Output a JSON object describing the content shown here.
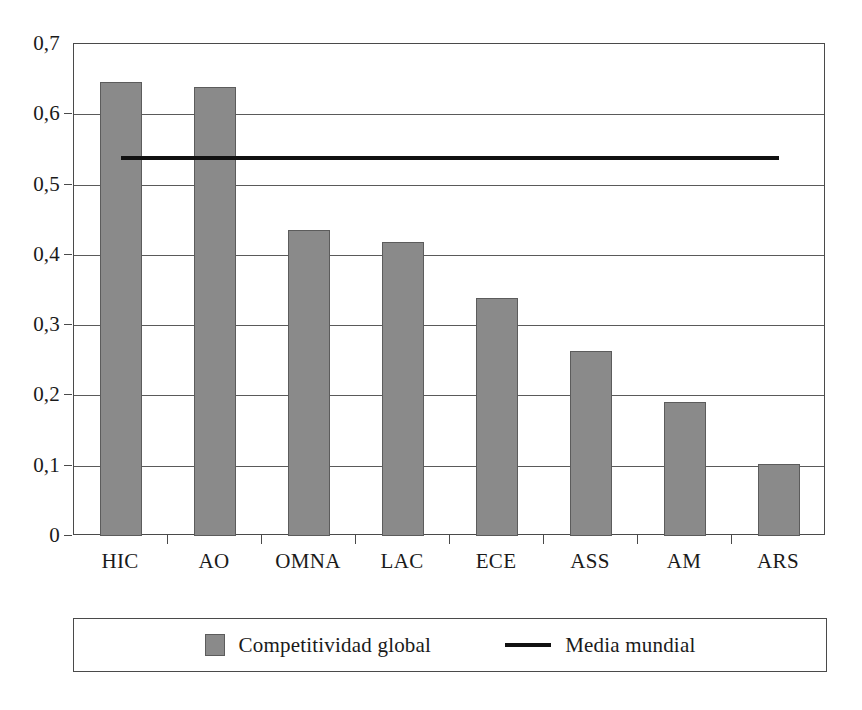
{
  "chart_data": {
    "type": "bar",
    "title": "",
    "subtitle": "",
    "xlabel": "",
    "ylabel": "",
    "categories": [
      "HIC",
      "AO",
      "OMNA",
      "LAC",
      "ECE",
      "ASS",
      "AM",
      "ARS"
    ],
    "series": [
      {
        "name": "Competitividad global",
        "type": "bar",
        "color": "#8a8a8a",
        "values": [
          0.646,
          0.639,
          0.436,
          0.419,
          0.339,
          0.263,
          0.19,
          0.103
        ]
      },
      {
        "name": "Media mundial",
        "type": "line",
        "color": "#111111",
        "constant_value": 0.54,
        "values": [
          0.54,
          0.54,
          0.54,
          0.54,
          0.54,
          0.54,
          0.54,
          0.54
        ]
      }
    ],
    "ylim": [
      0,
      0.7
    ],
    "ytick_labels": [
      "0,7",
      "0,6",
      "0,5",
      "0,4",
      "0,3",
      "0,2",
      "0,1",
      "0"
    ],
    "ytick_values": [
      0.7,
      0.6,
      0.5,
      0.4,
      0.3,
      0.2,
      0.1,
      0
    ],
    "grid": "horizontal",
    "legend_position": "bottom",
    "decimal_separator": ","
  },
  "legend": {
    "entries": [
      {
        "label": "Competitividad global",
        "marker": "bar-swatch-icon"
      },
      {
        "label": "Media mundial",
        "marker": "line-swatch-icon"
      }
    ]
  }
}
